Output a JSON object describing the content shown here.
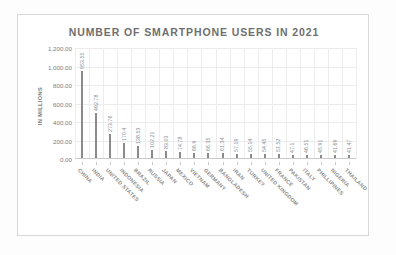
{
  "chart_data": {
    "type": "bar",
    "title": "NUMBER OF SMARTPHONE USERS IN 2021",
    "xlabel": "",
    "ylabel": "IN MILLIONS",
    "ylim": [
      0,
      1200
    ],
    "grid": true,
    "legend": "none",
    "ytick_labels": [
      "1,200.00",
      "1,000.00",
      "800.00",
      "600.00",
      "400.00",
      "200.00",
      "0.00"
    ],
    "ytick_values": [
      1200,
      1000,
      800,
      600,
      400,
      200,
      0
    ],
    "categories": [
      "CHINA",
      "INDIA",
      "UNITED STATES",
      "INDONESIA",
      "BRAZIL",
      "RUSSIA",
      "JAPAN",
      "MEXICO",
      "VIETNAM",
      "GERMANY",
      "BANGLADESH",
      "IRAN",
      "TURKEY",
      "UNITED KINGDOM",
      "FRANCE",
      "PAKISTAN",
      "ITALY",
      "PHILLIPINES",
      "NIGERIA",
      "THAILAND"
    ],
    "values": [
      953.55,
      492.78,
      273.76,
      170.4,
      138.53,
      102.21,
      83.03,
      74.78,
      66.9,
      66.35,
      61.34,
      57.19,
      55.14,
      54.45,
      51.52,
      47.1,
      46.51,
      45.91,
      41.69,
      41.47
    ],
    "value_labels": [
      "953.55",
      "492.78",
      "273.76",
      "170.4",
      "138.53",
      "102.21",
      "83.03",
      "74.78",
      "66.9",
      "66.35",
      "61.34",
      "57.19",
      "55.14",
      "54.45",
      "51.52",
      "47.1",
      "46.51",
      "45.91",
      "41.69",
      "41.47"
    ],
    "bar_color": "#8a8a8a",
    "title_color": "#6f6f6f",
    "label_color": "#8c8c8c",
    "grid_color": "#ececec"
  }
}
